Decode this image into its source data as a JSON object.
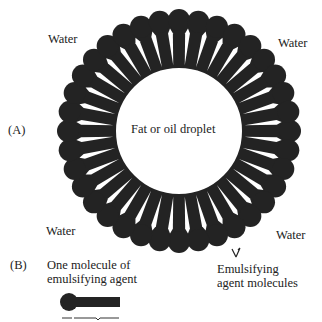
{
  "diagram": {
    "panel_a_label": "(A)",
    "panel_b_label": "(B)",
    "water_labels": [
      "Water",
      "Water",
      "Water",
      "Water"
    ],
    "droplet_label": "Fat or oil droplet",
    "molecules_label_line1": "Emulsifying",
    "molecules_label_line2": "agent molecules",
    "single_molecule_label_line1": "One molecule of",
    "single_molecule_label_line2": "emulsifying agent",
    "molecule_count": 36,
    "colors": {
      "ink": "#232323",
      "background": "#ffffff"
    }
  }
}
